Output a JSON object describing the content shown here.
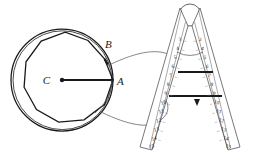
{
  "figure": {
    "background_color": "#ffffff",
    "ink_color": "#1a1a1a",
    "thin_ink_color": "#555555",
    "width": 254,
    "height": 160
  },
  "circle_diagram": {
    "name": "circle-with-inscribed-polygon",
    "center_label": "C",
    "radius_endpoint_label": "A",
    "vertex_label": "B",
    "polygon_sides": 11,
    "circle_center": [
      62,
      80
    ],
    "circle_radius": 51,
    "radius_segment": {
      "from": [
        62,
        80
      ],
      "to": [
        112,
        80
      ]
    },
    "center_dot_radius": 2.2,
    "labels": [
      {
        "text": "C",
        "x": 50,
        "y": 80,
        "anchor": "end"
      },
      {
        "text": "A",
        "x": 118,
        "y": 82,
        "anchor": "start"
      },
      {
        "text": "B",
        "x": 106,
        "y": 47,
        "anchor": "start"
      }
    ]
  },
  "sector_instrument": {
    "name": "proportional-compass-sector",
    "hinge": {
      "cx": 190,
      "cy": 15,
      "r": 11
    },
    "left_arm": {
      "name": "left-arm",
      "scale_numbers": [
        "3",
        "4",
        "5",
        "6",
        "7",
        "8",
        "9",
        "10",
        "11",
        "12",
        "13",
        "14",
        "15"
      ],
      "top": [
        176,
        26
      ],
      "bottom": [
        148,
        148
      ]
    },
    "right_arm": {
      "name": "right-arm",
      "scale_numbers": [
        "3",
        "4",
        "5",
        "6",
        "7",
        "8",
        "9",
        "10",
        "11",
        "12",
        "13",
        "14",
        "15"
      ],
      "top": [
        204,
        26
      ],
      "bottom": [
        232,
        148
      ]
    },
    "crossbars": [
      {
        "name": "upper-crossbar",
        "from": [
          179,
          72
        ],
        "to": [
          212,
          72
        ],
        "scale_value": "6"
      },
      {
        "name": "lower-crossbar",
        "from": [
          170,
          96
        ],
        "to": [
          221,
          96
        ],
        "scale_value": "9"
      }
    ],
    "angle_arc": {
      "name": "opening-angle-arc",
      "cx": 190,
      "cy": 26,
      "r": 28
    }
  },
  "leader_lines": [
    {
      "name": "upper-leader-arc",
      "from_label": "B-side chord endpoint",
      "to_label": "left arm value 4"
    },
    {
      "name": "lower-leader-arc",
      "from_label": "circle lower-right",
      "to_label": "left arm value 12"
    }
  ]
}
